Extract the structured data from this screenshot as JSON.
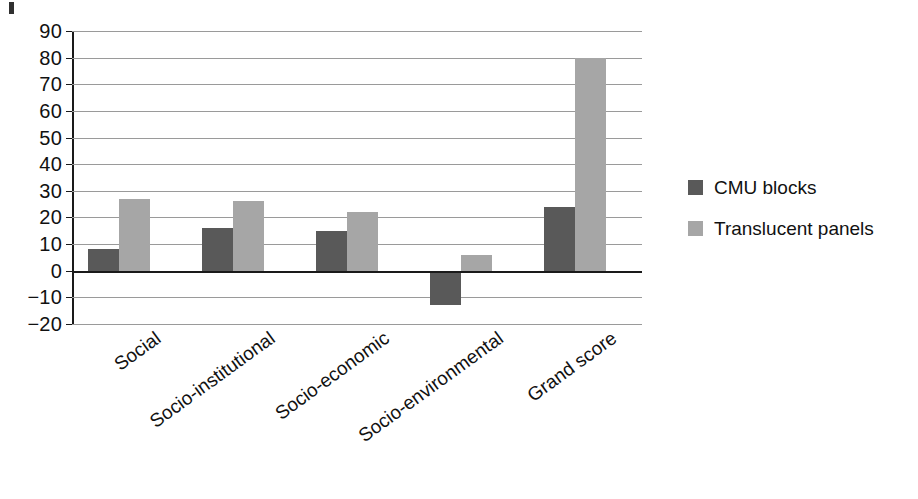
{
  "chart_data": {
    "type": "bar",
    "title": "",
    "subtitle": "",
    "xlabel": "",
    "ylabel": "",
    "categories": [
      "Social",
      "Socio-institutional",
      "Socio-economic",
      "Socio-environmental",
      "Grand score"
    ],
    "series": [
      {
        "name": "CMU blocks",
        "color": "#595959",
        "values": [
          8,
          16,
          15,
          -13,
          24
        ]
      },
      {
        "name": "Translucent panels",
        "color": "#a6a6a6",
        "values": [
          27,
          26,
          22,
          6,
          80
        ]
      }
    ],
    "ylim": [
      -20,
      90
    ],
    "ytick_step": 10,
    "yticks": [
      90,
      80,
      70,
      60,
      50,
      40,
      30,
      20,
      10,
      0,
      -10,
      -20
    ],
    "ytick_labels": [
      "90",
      "80",
      "70",
      "60",
      "50",
      "40",
      "30",
      "20",
      "10",
      "0",
      "−10",
      "−20"
    ],
    "grid": true,
    "grid_axis": "y",
    "zero_line": 0,
    "legend_position": "right",
    "orientation": "vertical",
    "xtick_rotation": -36,
    "background_color": "#ffffff",
    "axis_color": "#1a1a1a",
    "grid_color": "#9a9a9a"
  },
  "legend": {
    "items": [
      {
        "label": "CMU blocks",
        "color": "#595959"
      },
      {
        "label": "Translucent panels",
        "color": "#a6a6a6"
      }
    ]
  }
}
